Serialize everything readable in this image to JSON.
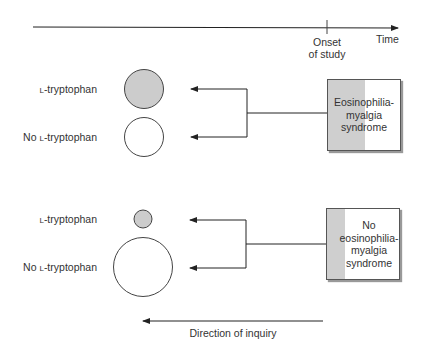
{
  "timeline": {
    "axis_label": "Time",
    "marker_label_line1": "Onset",
    "marker_label_line2": "of study"
  },
  "groups": [
    {
      "outcome_label": "Eosinophilia-\nmyalgia\nsyndrome",
      "outcome_lines": [
        "Eosinophilia-",
        "myalgia",
        "syndrome"
      ],
      "exposures": [
        {
          "prefix": "",
          "sc": "L",
          "suffix": "-tryptophan",
          "circle": "filled",
          "relative_size": "medium"
        },
        {
          "prefix": "No ",
          "sc": "L",
          "suffix": "-tryptophan",
          "circle": "open",
          "relative_size": "medium"
        }
      ]
    },
    {
      "outcome_label": "No\neosinophilia-\nmyalgia\nsyndrome",
      "outcome_lines": [
        "No",
        "eosinophilia-",
        "myalgia",
        "syndrome"
      ],
      "exposures": [
        {
          "prefix": "",
          "sc": "L",
          "suffix": "-tryptophan",
          "circle": "filled",
          "relative_size": "small"
        },
        {
          "prefix": "No ",
          "sc": "L",
          "suffix": "-tryptophan",
          "circle": "open",
          "relative_size": "large"
        }
      ]
    }
  ],
  "direction_label": "Direction of inquiry",
  "colors": {
    "line": "#222222",
    "filled_circle": "#cccccc",
    "box_shade": "#cfcfcf",
    "text": "#333333"
  }
}
